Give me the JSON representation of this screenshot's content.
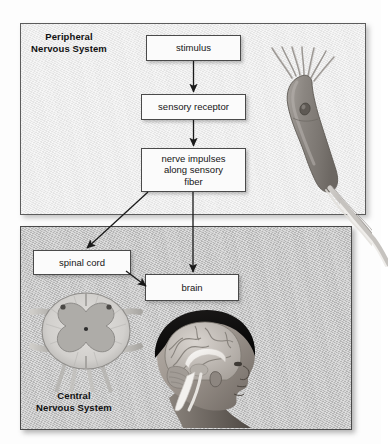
{
  "diagram": {
    "colors": {
      "pns_panel_bg": "#f0f0f0",
      "cns_panel_bg": "#bdbdbd",
      "box_bg": "#fbfbfb",
      "border": "#4a4a4a",
      "text": "#151515",
      "neuron_body": "#8f8c8a",
      "page_bg": "#ffffff"
    },
    "panels": [
      {
        "id": "peripheral",
        "title_line1": "Peripheral",
        "title_line2": "Nervous System",
        "title_position": "top-left"
      },
      {
        "id": "central",
        "title_line1": "Central",
        "title_line2": "Nervous System",
        "title_position": "bottom-left"
      }
    ],
    "boxes": [
      {
        "id": "stimulus",
        "label": "stimulus",
        "panel": "peripheral"
      },
      {
        "id": "sensory-receptor",
        "label": "sensory receptor",
        "panel": "peripheral"
      },
      {
        "id": "nerve-impulses",
        "label_line1": "nerve impulses",
        "label_line2": "along sensory",
        "label_line3": "fiber",
        "panel": "peripheral"
      },
      {
        "id": "spinal-cord",
        "label": "spinal cord",
        "panel": "central"
      },
      {
        "id": "brain",
        "label": "brain",
        "panel": "central"
      }
    ],
    "arrows": [
      {
        "from": "stimulus",
        "to": "sensory-receptor",
        "style": "straight-down"
      },
      {
        "from": "sensory-receptor",
        "to": "nerve-impulses",
        "style": "straight-down"
      },
      {
        "from": "nerve-impulses",
        "to": "spinal-cord",
        "style": "diagonal-down-left"
      },
      {
        "from": "nerve-impulses",
        "to": "brain",
        "style": "straight-down"
      },
      {
        "from": "spinal-cord",
        "to": "brain",
        "style": "diagonal-down-right"
      }
    ],
    "illustrations": [
      {
        "id": "sensory-neuron",
        "caption": "sensory receptor neuron with hair-like dendrites and long axon",
        "panel": "peripheral"
      },
      {
        "id": "spinal-cord-cross-section",
        "caption": "spinal cord cross section showing butterfly-shaped gray matter",
        "panel": "central"
      },
      {
        "id": "head-sagittal-brain",
        "caption": "sagittal view of human head showing the brain",
        "panel": "central"
      }
    ]
  }
}
